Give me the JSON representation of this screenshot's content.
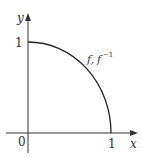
{
  "diagram": {
    "type": "function-graph",
    "curve": {
      "label_f": "f,",
      "label_finv_base": "f",
      "label_finv_sup": "−1",
      "description": "quarter circle from (0,1) to (1,0)"
    },
    "axes": {
      "x_label": "x",
      "y_label": "y",
      "origin_label": "0",
      "x_tick_label": "1",
      "y_tick_label": "1"
    },
    "colors": {
      "axis": "#333333",
      "curve": "#222222",
      "text": "#333333"
    }
  }
}
